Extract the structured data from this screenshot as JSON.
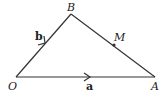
{
  "diagram": {
    "type": "vector-triangle",
    "points": {
      "O": {
        "label": "O",
        "x": 16,
        "y": 77
      },
      "A": {
        "label": "A",
        "x": 155,
        "y": 77
      },
      "B": {
        "label": "B",
        "x": 71,
        "y": 14
      },
      "M": {
        "label": "M",
        "x": 114,
        "y": 44
      }
    },
    "vectors": [
      {
        "from": "O",
        "to": "B",
        "label": "b"
      },
      {
        "from": "O",
        "to": "A",
        "label": "a"
      }
    ],
    "segments": [
      {
        "from": "B",
        "to": "A",
        "contains_point": "M"
      }
    ],
    "line_color": "#333333"
  }
}
